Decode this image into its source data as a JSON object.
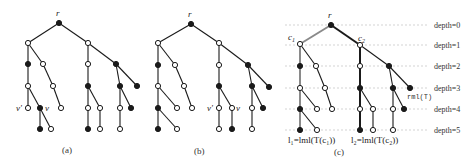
{
  "figure": {
    "panels": [
      {
        "id": "a",
        "caption": "(a)",
        "root_label": "r",
        "node_labels": {
          "v_prime": "v'",
          "v": "v"
        }
      },
      {
        "id": "b",
        "caption": "(b)",
        "root_label": "r",
        "node_labels": {
          "v_prime": "v'",
          "v": "v"
        }
      },
      {
        "id": "c",
        "caption": "(c)",
        "root_label": "r",
        "node_labels": {
          "c1": "c",
          "c1_sub": "1",
          "c2": "c",
          "c2_sub": "2",
          "rml": "rml(T)",
          "l1": "l₁=lml(T(c₁))",
          "l2": "l₂=lml(T(c₂))"
        },
        "depth_labels": [
          "depth=0",
          "depth=1",
          "depth=2",
          "depth=3",
          "depth=4",
          "depth=5"
        ]
      }
    ],
    "colors": {
      "edge": "#1a1a1a",
      "highlight_gray": "#8a8a8a",
      "filled_node": "#1a1a1a",
      "open_node_fill": "#ffffff",
      "depth_line": "#c8c8c8"
    }
  }
}
